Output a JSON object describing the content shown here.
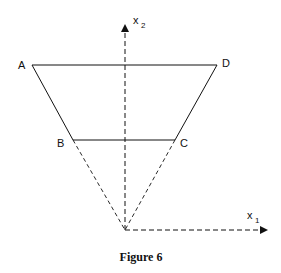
{
  "figure": {
    "caption": "Figure 6",
    "points": {
      "A": "A",
      "B": "B",
      "C": "C",
      "D": "D"
    },
    "axes": {
      "x1": {
        "label": "x",
        "subscript": "1"
      },
      "x2": {
        "label": "x",
        "subscript": "2"
      }
    },
    "shape": "trapezoid ABCD with dashed extensions of AB and DC meeting at origin",
    "colors": {
      "line": "#111111",
      "background": "#ffffff"
    }
  }
}
